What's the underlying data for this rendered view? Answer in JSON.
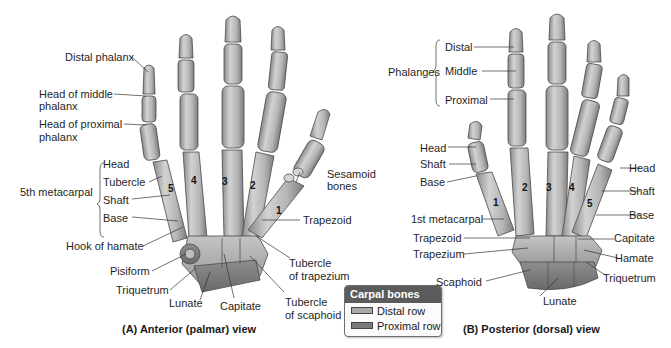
{
  "figure": {
    "panel_a": {
      "caption": "(A) Anterior (palmar) view",
      "labels": {
        "distal_phalanx": "Distal phalanx",
        "head_middle_1": "Head of middle",
        "head_middle_2": "phalanx",
        "head_proximal_1": "Head of proximal",
        "head_proximal_2": "phalanx",
        "fifth_metacarpal": "5th metacarpal",
        "head": "Head",
        "tubercle": "Tubercle",
        "shaft": "Shaft",
        "base": "Base",
        "hook_of_hamate": "Hook of hamate",
        "pisiform": "Pisiform",
        "triquetrum": "Triquetrum",
        "lunate": "Lunate",
        "capitate": "Capitate",
        "sesamoid_1": "Sesamoid",
        "sesamoid_2": "bones",
        "trapezoid": "Trapezoid",
        "tubercle_trapezium_1": "Tubercle",
        "tubercle_trapezium_2": "of trapezium",
        "tubercle_scaphoid_1": "Tubercle",
        "tubercle_scaphoid_2": "of scaphoid"
      },
      "metacarpal_numbers": [
        "5",
        "4",
        "3",
        "2",
        "1"
      ]
    },
    "panel_b": {
      "caption": "(B) Posterior (dorsal) view",
      "labels": {
        "phalanges": "Phalanges",
        "distal": "Distal",
        "middle": "Middle",
        "proximal": "Proximal",
        "head_left": "Head",
        "shaft_left": "Shaft",
        "base_left": "Base",
        "first_metacarpal": "1st metacarpal",
        "trapezoid": "Trapezoid",
        "trapezium": "Trapezium",
        "scaphoid": "Scaphoid",
        "lunate": "Lunate",
        "head_right": "Head",
        "shaft_right": "Shaft",
        "base_right": "Base",
        "capitate": "Capitate",
        "hamate": "Hamate",
        "triquetrum": "Triquetrum"
      },
      "metacarpal_numbers": [
        "1",
        "2",
        "3",
        "4",
        "5"
      ]
    },
    "legend": {
      "title": "Carpal bones",
      "items": [
        {
          "label": "Distal row",
          "color": "#a9a9a9"
        },
        {
          "label": "Proximal row",
          "color": "#7a7a7a"
        }
      ],
      "header_color": "#5b5b5b"
    },
    "colors": {
      "bone_light": "#c9c9c9",
      "bone_mid": "#a6a6a6",
      "bone_dark": "#6f6f6f",
      "leader_line": "#333333"
    }
  }
}
